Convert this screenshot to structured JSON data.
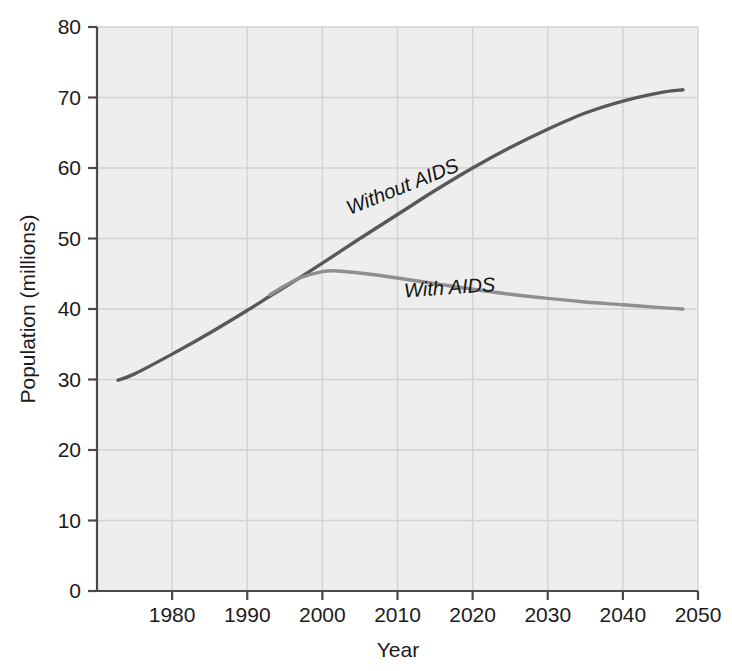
{
  "chart_data": {
    "type": "line",
    "title": "",
    "xlabel": "Year",
    "ylabel": "Population (millions)",
    "xlim": [
      1970,
      2050
    ],
    "ylim": [
      0,
      80
    ],
    "grid": true,
    "legend_position": "inline-annotations",
    "x_ticks": [
      "1980",
      "1990",
      "2000",
      "2010",
      "2020",
      "2030",
      "2040",
      "2050"
    ],
    "x_tick_values": [
      1980,
      1990,
      2000,
      2010,
      2020,
      2030,
      2040,
      2050
    ],
    "y_ticks": [
      "0",
      "10",
      "20",
      "30",
      "40",
      "50",
      "60",
      "70",
      "80"
    ],
    "y_tick_values": [
      0,
      10,
      20,
      30,
      40,
      50,
      60,
      70,
      80
    ],
    "colors": {
      "background": "#eeeeee",
      "gridline": "#d2d2d2",
      "axis": "#4a4a4a",
      "without_aids": "#585858",
      "with_aids": "#8f8f8f",
      "text": "#1b1b1b"
    },
    "series": [
      {
        "name": "Without AIDS",
        "color": "#585858",
        "label_text": "Without AIDS",
        "label_x": 2011,
        "label_y": 56.5,
        "label_rotation": -22,
        "x": [
          1972.8,
          1975,
          1980,
          1985,
          1990,
          1993,
          1995,
          2000,
          2005,
          2010,
          2015,
          2020,
          2025,
          2030,
          2035,
          2040,
          2045,
          2048
        ],
        "values": [
          29.9,
          30.8,
          33.6,
          36.6,
          39.8,
          41.8,
          43.1,
          46.5,
          50.0,
          53.4,
          56.8,
          60.0,
          62.9,
          65.5,
          67.8,
          69.5,
          70.7,
          71.1
        ]
      },
      {
        "name": "With AIDS",
        "color": "#8f8f8f",
        "label_text": "With AIDS",
        "label_x": 2017,
        "label_y": 42.1,
        "label_rotation": -4,
        "x": [
          1993,
          1995,
          1997,
          2000,
          2002,
          2005,
          2010,
          2015,
          2020,
          2025,
          2030,
          2035,
          2040,
          2045,
          2048
        ],
        "values": [
          42.0,
          43.3,
          44.4,
          45.3,
          45.4,
          45.1,
          44.4,
          43.6,
          42.8,
          42.1,
          41.5,
          41.0,
          40.6,
          40.2,
          40.0
        ]
      }
    ]
  }
}
